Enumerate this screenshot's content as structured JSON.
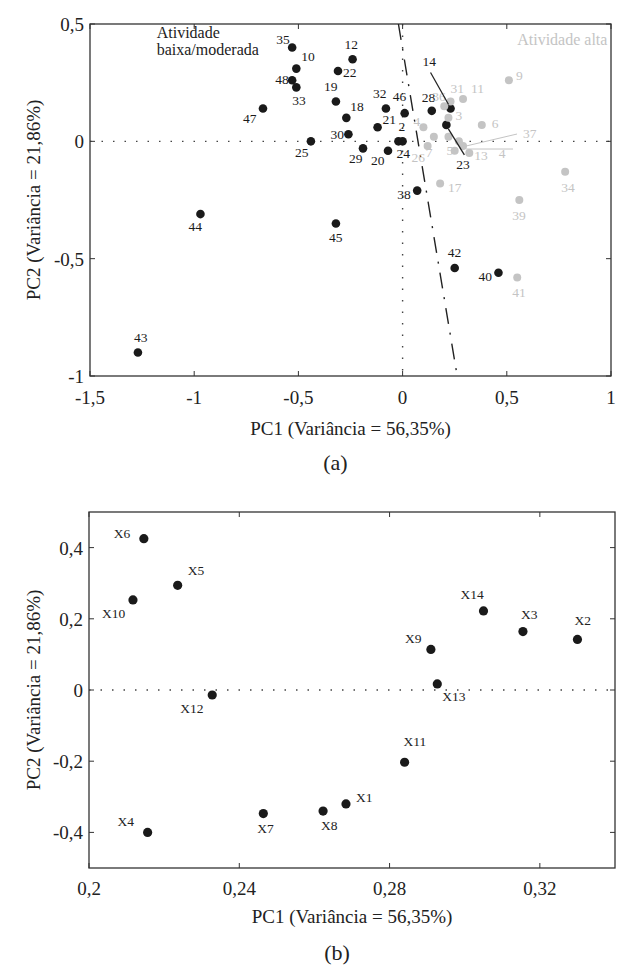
{
  "chart_data": [
    {
      "id": "a",
      "type": "scatter",
      "caption": "(a)",
      "title": "",
      "xlabel": "PC1 (Variância = 56,35%)",
      "ylabel": "PC2 (Variância = 21,86%)",
      "xlim": [
        -1.5,
        1
      ],
      "ylim": [
        -1,
        0.5
      ],
      "xticks": [
        -1.5,
        -1,
        -0.5,
        0,
        0.5,
        1
      ],
      "xtick_labels": [
        "-1,5",
        "-1",
        "-0,5",
        "0",
        "0,5",
        "1"
      ],
      "yticks": [
        -1,
        -0.5,
        0,
        0.5
      ],
      "ytick_labels": [
        "-1",
        "-0,5",
        "0",
        "0,5"
      ],
      "grid": false,
      "zero_lines": "dotted",
      "annotations": [
        {
          "text": "Atividade",
          "x": -1.18,
          "y": 0.44,
          "color": "#222222"
        },
        {
          "text": "baixa/moderada",
          "x": -1.18,
          "y": 0.37,
          "color": "#222222"
        },
        {
          "text": "Atividade alta",
          "x": 0.55,
          "y": 0.41,
          "color": "#c4c4c4"
        }
      ],
      "discriminant_line": {
        "style": "dash-dot",
        "from": [
          -0.02,
          0.5
        ],
        "to": [
          0.26,
          -0.99
        ]
      },
      "series": [
        {
          "name": "Atividade baixa/moderada",
          "color": "#1a1a1a",
          "points": [
            {
              "label": "35",
              "x": -0.53,
              "y": 0.4,
              "lx": -16,
              "ly": -3
            },
            {
              "label": "10",
              "x": -0.51,
              "y": 0.31,
              "lx": 5,
              "ly": -8
            },
            {
              "label": "48",
              "x": -0.53,
              "y": 0.26,
              "lx": -17,
              "ly": 4
            },
            {
              "label": "33",
              "x": -0.51,
              "y": 0.23,
              "lx": -4,
              "ly": 18
            },
            {
              "label": "47",
              "x": -0.67,
              "y": 0.14,
              "lx": -20,
              "ly": 15
            },
            {
              "label": "25",
              "x": -0.44,
              "y": 0.0,
              "lx": -16,
              "ly": 16
            },
            {
              "label": "12",
              "x": -0.24,
              "y": 0.35,
              "lx": -8,
              "ly": -10
            },
            {
              "label": "22",
              "x": -0.31,
              "y": 0.3,
              "lx": 5,
              "ly": 6
            },
            {
              "label": "19",
              "x": -0.32,
              "y": 0.17,
              "lx": -12,
              "ly": -10
            },
            {
              "label": "18",
              "x": -0.27,
              "y": 0.1,
              "lx": 4,
              "ly": -7
            },
            {
              "label": "30",
              "x": -0.26,
              "y": 0.03,
              "lx": -18,
              "ly": 5
            },
            {
              "label": "29",
              "x": -0.19,
              "y": -0.03,
              "lx": -14,
              "ly": 15
            },
            {
              "label": "20",
              "x": -0.07,
              "y": -0.04,
              "lx": -17,
              "ly": 14
            },
            {
              "label": "24",
              "x": -0.02,
              "y": 0.0,
              "lx": -2,
              "ly": 17
            },
            {
              "label": "",
              "x": 0.0,
              "y": 0.0,
              "lx": 0,
              "ly": 0
            },
            {
              "label": "21",
              "x": -0.12,
              "y": 0.06,
              "lx": 5,
              "ly": -3
            },
            {
              "label": "32",
              "x": -0.08,
              "y": 0.14,
              "lx": -13,
              "ly": -10
            },
            {
              "label": "46",
              "x": 0.01,
              "y": 0.12,
              "lx": -12,
              "ly": -12
            },
            {
              "label": "2",
              "x": 0.0,
              "y": 0.06,
              "lx": -4,
              "ly": 4,
              "hidden_marker": true
            },
            {
              "label": "28",
              "x": 0.14,
              "y": 0.13,
              "lx": -10,
              "ly": -9
            },
            {
              "label": "14",
              "x": 0.23,
              "y": 0.14,
              "lx": -28,
              "ly": -42
            },
            {
              "label": "23",
              "x": 0.21,
              "y": 0.07,
              "lx": 10,
              "ly": 44
            },
            {
              "label": "38",
              "x": 0.07,
              "y": -0.21,
              "lx": -20,
              "ly": 8
            },
            {
              "label": "45",
              "x": -0.32,
              "y": -0.35,
              "lx": -7,
              "ly": 19
            },
            {
              "label": "44",
              "x": -0.97,
              "y": -0.31,
              "lx": -12,
              "ly": 17
            },
            {
              "label": "43",
              "x": -1.27,
              "y": -0.9,
              "lx": -4,
              "ly": -11
            },
            {
              "label": "42",
              "x": 0.25,
              "y": -0.54,
              "lx": -7,
              "ly": -11
            },
            {
              "label": "40",
              "x": 0.46,
              "y": -0.56,
              "lx": -20,
              "ly": 8
            }
          ]
        },
        {
          "name": "Atividade alta",
          "color": "#c4c4c4",
          "points": [
            {
              "label": "9",
              "x": 0.51,
              "y": 0.26,
              "lx": 7,
              "ly": 0
            },
            {
              "label": "36",
              "x": 0.2,
              "y": 0.15,
              "lx": -12,
              "ly": -5
            },
            {
              "label": "31",
              "x": 0.23,
              "y": 0.17,
              "lx": 0,
              "ly": -8
            },
            {
              "label": "11",
              "x": 0.29,
              "y": 0.18,
              "lx": 8,
              "ly": -6
            },
            {
              "label": "3",
              "x": 0.22,
              "y": 0.1,
              "lx": 7,
              "ly": 2
            },
            {
              "label": "4",
              "x": 0.1,
              "y": 0.06,
              "lx": -10,
              "ly": -1
            },
            {
              "label": "7",
              "x": 0.15,
              "y": 0.02,
              "lx": -8,
              "ly": 20
            },
            {
              "label": "26",
              "x": 0.12,
              "y": -0.02,
              "lx": -16,
              "ly": 16
            },
            {
              "label": "5",
              "x": 0.22,
              "y": 0.02,
              "lx": -2,
              "ly": 18
            },
            {
              "label": "1",
              "x": 0.27,
              "y": 0.0,
              "lx": 0,
              "ly": 0,
              "hidden_label": true
            },
            {
              "label": "37",
              "x": 0.29,
              "y": -0.02,
              "lx": 60,
              "ly": -8,
              "leader": true
            },
            {
              "label": "4",
              "x": 0.25,
              "y": -0.04,
              "lx": 44,
              "ly": 7
            },
            {
              "label": "13",
              "x": 0.32,
              "y": -0.05,
              "lx": 5,
              "ly": 7
            },
            {
              "label": "6",
              "x": 0.38,
              "y": 0.07,
              "lx": 10,
              "ly": 3
            },
            {
              "label": "17",
              "x": 0.18,
              "y": -0.18,
              "lx": 8,
              "ly": 8
            },
            {
              "label": "34",
              "x": 0.78,
              "y": -0.13,
              "lx": -4,
              "ly": 20
            },
            {
              "label": "39",
              "x": 0.56,
              "y": -0.25,
              "lx": -7,
              "ly": 20
            },
            {
              "label": "41",
              "x": 0.55,
              "y": -0.58,
              "lx": -5,
              "ly": 20
            }
          ]
        }
      ]
    },
    {
      "id": "b",
      "type": "scatter",
      "caption": "(b)",
      "title": "",
      "xlabel": "PC1 (Variância = 56,35%)",
      "ylabel": "PC2 (Variância = 21,86%)",
      "xlim": [
        0.2,
        0.34
      ],
      "ylim": [
        -0.5,
        0.5
      ],
      "xticks": [
        0.2,
        0.24,
        0.28,
        0.32
      ],
      "xtick_labels": [
        "0,2",
        "0,24",
        "0,28",
        "0,32"
      ],
      "yticks": [
        -0.4,
        -0.2,
        0,
        0.2,
        0.4
      ],
      "ytick_labels": [
        "-0,4",
        "-0,2",
        "0",
        "0,2",
        "0,4"
      ],
      "grid": false,
      "zero_lines": "dotted-horizontal",
      "series": [
        {
          "name": "Variáveis",
          "color": "#1a1a1a",
          "points": [
            {
              "label": "X1",
              "x": 0.2684,
              "y": -0.32,
              "lx": 10,
              "ly": -2
            },
            {
              "label": "X2",
              "x": 0.33,
              "y": 0.142,
              "lx": -3,
              "ly": -14
            },
            {
              "label": "X3",
              "x": 0.3155,
              "y": 0.164,
              "lx": -2,
              "ly": -13
            },
            {
              "label": "X4",
              "x": 0.2156,
              "y": -0.4,
              "lx": -30,
              "ly": -6
            },
            {
              "label": "X5",
              "x": 0.2236,
              "y": 0.294,
              "lx": 10,
              "ly": -10
            },
            {
              "label": "X6",
              "x": 0.2146,
              "y": 0.425,
              "lx": -30,
              "ly": -1
            },
            {
              "label": "X7",
              "x": 0.2464,
              "y": -0.347,
              "lx": -6,
              "ly": 19
            },
            {
              "label": "X8",
              "x": 0.2623,
              "y": -0.34,
              "lx": -2,
              "ly": 19
            },
            {
              "label": "X9",
              "x": 0.291,
              "y": 0.114,
              "lx": -26,
              "ly": -6
            },
            {
              "label": "X10",
              "x": 0.2117,
              "y": 0.253,
              "lx": -31,
              "ly": 18
            },
            {
              "label": "X11",
              "x": 0.284,
              "y": -0.203,
              "lx": -1,
              "ly": -16
            },
            {
              "label": "X12",
              "x": 0.2328,
              "y": -0.014,
              "lx": -32,
              "ly": 18
            },
            {
              "label": "X13",
              "x": 0.2927,
              "y": 0.017,
              "lx": 5,
              "ly": 17
            },
            {
              "label": "X14",
              "x": 0.305,
              "y": 0.222,
              "lx": -23,
              "ly": -12
            }
          ]
        }
      ]
    }
  ]
}
